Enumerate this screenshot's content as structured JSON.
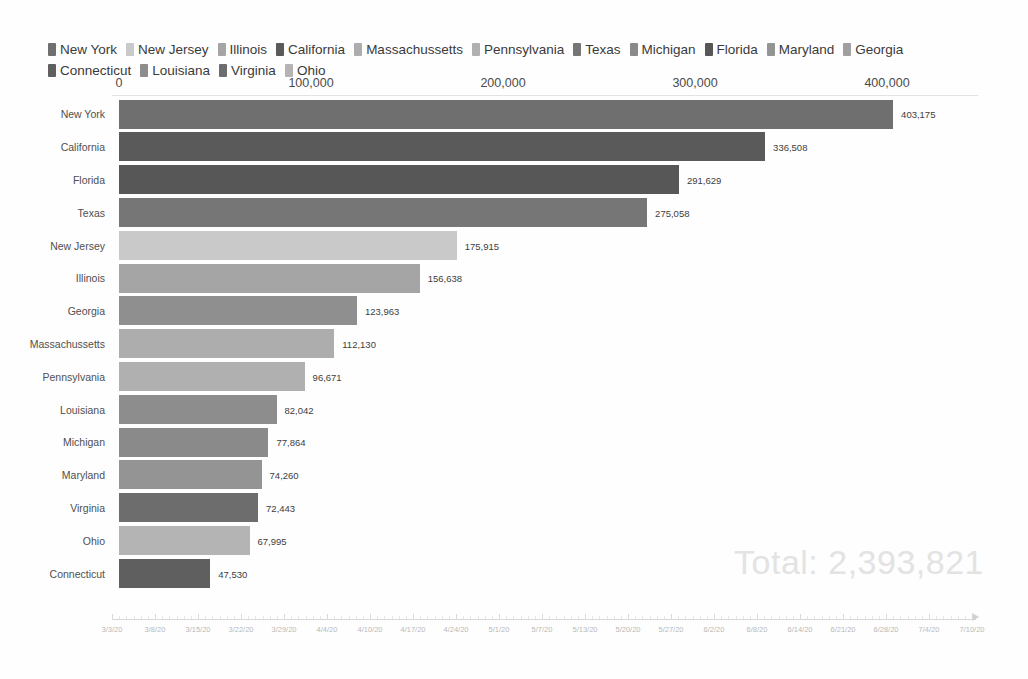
{
  "legend": {
    "items": [
      {
        "label": "New York",
        "color": "#6f6f6f"
      },
      {
        "label": "New Jersey",
        "color": "#c9c9c9"
      },
      {
        "label": "Illinois",
        "color": "#a5a5a5"
      },
      {
        "label": "California",
        "color": "#5a5a5a"
      },
      {
        "label": "Massachussetts",
        "color": "#adadad"
      },
      {
        "label": "Pennsylvania",
        "color": "#b0b0b0"
      },
      {
        "label": "Texas",
        "color": "#767676"
      },
      {
        "label": "Michigan",
        "color": "#8a8a8a"
      },
      {
        "label": "Florida",
        "color": "#575757"
      },
      {
        "label": "Maryland",
        "color": "#949494"
      },
      {
        "label": "Georgia",
        "color": "#a0a0a0"
      },
      {
        "label": "Connecticut",
        "color": "#5f5f5f"
      },
      {
        "label": "Louisiana",
        "color": "#8d8d8d"
      },
      {
        "label": "Virginia",
        "color": "#6d6d6d"
      },
      {
        "label": "Ohio",
        "color": "#b4b4b4"
      }
    ]
  },
  "chart_data": {
    "type": "bar",
    "orientation": "horizontal",
    "title": "",
    "xlabel": "",
    "ylabel": "",
    "xlim": [
      0,
      420000
    ],
    "grid": false,
    "legend_position": "top",
    "axis_ticks": [
      {
        "label": "0",
        "value": 0
      },
      {
        "label": "100,000",
        "value": 100000
      },
      {
        "label": "200,000",
        "value": 200000
      },
      {
        "label": "300,000",
        "value": 300000
      },
      {
        "label": "400,000",
        "value": 400000
      }
    ],
    "categories": [
      "New York",
      "California",
      "Florida",
      "Texas",
      "New Jersey",
      "Illinois",
      "Georgia",
      "Massachussetts",
      "Pennsylvania",
      "Louisiana",
      "Michigan",
      "Maryland",
      "Virginia",
      "Ohio",
      "Connecticut"
    ],
    "values": [
      403175,
      336508,
      291629,
      275058,
      175915,
      156638,
      123963,
      112130,
      96671,
      82042,
      77864,
      74260,
      72443,
      67995,
      47530
    ],
    "value_labels": [
      "403,175",
      "336,508",
      "291,629",
      "275,058",
      "175,915",
      "156,638",
      "123,963",
      "112,130",
      "96,671",
      "82,042",
      "77,864",
      "74,260",
      "72,443",
      "67,995",
      "47,530"
    ],
    "bar_colors": [
      "#6f6f6f",
      "#5a5a5a",
      "#575757",
      "#767676",
      "#c9c9c9",
      "#a5a5a5",
      "#8f8f8f",
      "#adadad",
      "#b0b0b0",
      "#8d8d8d",
      "#8a8a8a",
      "#949494",
      "#6d6d6d",
      "#b4b4b4",
      "#5f5f5f"
    ]
  },
  "total": {
    "text": "Total: 2,393,821",
    "color": "#e3e3e3"
  },
  "timeline": {
    "labels": [
      "3/3/20",
      "3/8/20",
      "3/15/20",
      "3/22/20",
      "3/29/20",
      "4/4/20",
      "4/10/20",
      "4/17/20",
      "4/24/20",
      "5/1/20",
      "5/7/20",
      "5/13/20",
      "5/20/20",
      "5/27/20",
      "6/2/20",
      "6/8/20",
      "6/14/20",
      "6/21/20",
      "6/28/20",
      "7/4/20",
      "7/10/20"
    ]
  }
}
